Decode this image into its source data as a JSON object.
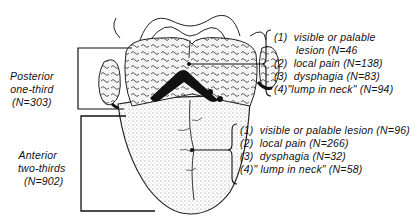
{
  "diagram": {
    "regions": [
      {
        "id": "posterior",
        "label_line1": "Posterior",
        "label_line2": "one-third",
        "count": "(N=303)",
        "findings": [
          {
            "num": "(1)",
            "text": "visible or palable"
          },
          {
            "num": "",
            "text": "lesion (N=46"
          },
          {
            "num": "(2)",
            "text": "local pain (N=138)"
          },
          {
            "num": "(3)",
            "text": "dysphagia (N=83)"
          },
          {
            "num": "(4)",
            "text": "\"lump in neck\" (N=94)"
          }
        ]
      },
      {
        "id": "anterior",
        "label_line1": "Anterior",
        "label_line2": "two-thirds",
        "count": "(N=902)",
        "findings": [
          {
            "num": "(1)",
            "text": "visible or palable lesion (N=96)"
          },
          {
            "num": "(2)",
            "text": "local pain (N=266)"
          },
          {
            "num": "(3)",
            "text": "dysphagia (N=32)"
          },
          {
            "num": "(4)",
            "text": "\" lump in neck\" (N=58)"
          }
        ]
      }
    ],
    "colors": {
      "ink": "#111111",
      "paper": "#ffffff",
      "stipple": "#9a9a9a"
    }
  }
}
